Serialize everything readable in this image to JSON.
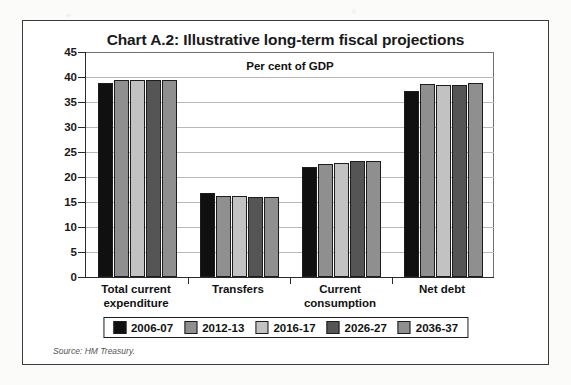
{
  "figure": {
    "title": "Chart A.2: Illustrative long-term fiscal projections",
    "subtitle": "Per cent of GDP",
    "source": "Source: HM Treasury."
  },
  "chart_data": {
    "type": "bar",
    "title": "Chart A.2: Illustrative long-term fiscal projections",
    "subtitle": "Per cent of GDP",
    "xlabel": "",
    "ylabel": "Per cent of GDP",
    "ylim": [
      0,
      45
    ],
    "ytick_step": 5,
    "yticks": [
      "0",
      "5",
      "10",
      "15",
      "20",
      "25",
      "30",
      "35",
      "40",
      "45"
    ],
    "grid": true,
    "legend_position": "bottom",
    "categories": [
      "Total current expenditure",
      "Transfers",
      "Current consumption",
      "Net debt"
    ],
    "category_lines": [
      [
        "Total current",
        "expenditure"
      ],
      [
        "Transfers",
        ""
      ],
      [
        "Current",
        "consumption"
      ],
      [
        "Net debt",
        ""
      ]
    ],
    "series": [
      {
        "name": "2006-07",
        "color": "#101010",
        "values": [
          38.9,
          16.8,
          22.0,
          37.3
        ]
      },
      {
        "name": "2012-13",
        "color": "#8f8f8f",
        "values": [
          39.4,
          16.2,
          22.7,
          38.6
        ]
      },
      {
        "name": "2016-17",
        "color": "#c2c2c2",
        "values": [
          39.4,
          16.2,
          22.8,
          38.4
        ]
      },
      {
        "name": "2026-27",
        "color": "#555555",
        "values": [
          39.4,
          16.1,
          23.2,
          38.5
        ]
      },
      {
        "name": "2036-37",
        "color": "#8f8f8f",
        "values": [
          39.5,
          16.1,
          23.3,
          38.9
        ]
      }
    ]
  },
  "colors": {
    "frame": "#3b3b3b",
    "axis": "#2b2b2b",
    "gridline": "#b9b9b9",
    "text": "#111111",
    "source_text": "#555555"
  }
}
